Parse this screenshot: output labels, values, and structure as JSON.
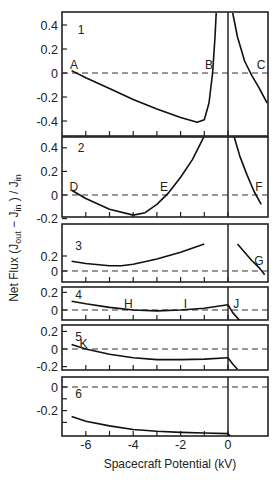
{
  "chart_data": {
    "type": "line",
    "title": "",
    "xlabel": "Spacecraft Potential (kV)",
    "ylabel": "Net Flux (J_out - J_in) / J_in",
    "xlim": [
      -7.0,
      1.7
    ],
    "x_ticks": [
      -6,
      -5,
      -4,
      -3,
      -2,
      -1,
      0
    ],
    "x_tick_labels": [
      "-6",
      "-4",
      "-2",
      "0"
    ],
    "x_tick_label_values": [
      -6,
      -4,
      -2,
      0
    ],
    "grid": false,
    "zero_line": "dashed",
    "vertical_line_at": 0,
    "panels": [
      {
        "id": "1",
        "ylim": [
          -0.5,
          0.5
        ],
        "y_ticks": [
          0.4,
          0.2,
          0,
          -0.2,
          -0.4
        ],
        "y_tick_labels": [
          "0.4",
          "0.2",
          "0",
          "-0.2",
          "-0.4"
        ],
        "px": {
          "top": 12,
          "bottom": 136,
          "y0": 73,
          "unit": 120
        },
        "series": [
          {
            "name": "negative branch",
            "x": [
              -6.6,
              -6.0,
              -5.0,
              -4.0,
              -3.0,
              -2.0,
              -1.3,
              -1.0,
              -0.8,
              -0.65,
              -0.55,
              -0.5
            ],
            "y": [
              0.02,
              -0.04,
              -0.13,
              -0.22,
              -0.3,
              -0.37,
              -0.41,
              -0.39,
              -0.25,
              0.0,
              0.3,
              0.5
            ]
          },
          {
            "name": "positive branch",
            "x": [
              0.2,
              0.4,
              0.7,
              1.0,
              1.3,
              1.65
            ],
            "y": [
              0.5,
              0.3,
              0.1,
              -0.02,
              -0.12,
              -0.25
            ]
          }
        ],
        "annotations": [
          {
            "text": "1",
            "x": -6.2,
            "y": 0.36
          },
          {
            "text": "A",
            "x": -6.5,
            "y": 0.07
          },
          {
            "text": "B",
            "x": -0.8,
            "y": 0.07
          },
          {
            "text": "C",
            "x": 1.4,
            "y": 0.07
          }
        ]
      },
      {
        "id": "2",
        "ylim": [
          -0.25,
          0.5
        ],
        "y_ticks": [
          0.4,
          0.2,
          0,
          -0.2
        ],
        "y_tick_labels": [
          "0.4",
          "0.2",
          "0",
          "-0.2"
        ],
        "px": {
          "top": 137,
          "bottom": 217,
          "y0": 195,
          "unit": 118
        },
        "series": [
          {
            "name": "negative branch",
            "x": [
              -6.6,
              -6.0,
              -5.0,
              -4.0,
              -3.5,
              -3.0,
              -2.5,
              -2.0,
              -1.5,
              -1.0
            ],
            "y": [
              0.04,
              -0.03,
              -0.12,
              -0.17,
              -0.15,
              -0.08,
              0.02,
              0.15,
              0.3,
              0.5
            ]
          },
          {
            "name": "positive branch",
            "x": [
              0.25,
              0.5,
              0.8,
              1.1,
              1.4
            ],
            "y": [
              0.5,
              0.33,
              0.17,
              0.03,
              -0.08
            ]
          }
        ],
        "annotations": [
          {
            "text": "2",
            "x": -6.2,
            "y": 0.4
          },
          {
            "text": "D",
            "x": -6.5,
            "y": 0.07
          },
          {
            "text": "E",
            "x": -2.7,
            "y": 0.07
          },
          {
            "text": "F",
            "x": 1.3,
            "y": 0.07
          }
        ]
      },
      {
        "id": "3",
        "ylim": [
          -0.07,
          0.45
        ],
        "y_ticks": [
          0.2,
          0
        ],
        "y_tick_labels": [
          "0.2",
          "0"
        ],
        "px": {
          "top": 224,
          "bottom": 282,
          "y0": 271,
          "unit": 75
        },
        "series": [
          {
            "name": "negative branch",
            "x": [
              -6.6,
              -6.0,
              -5.0,
              -4.5,
              -4.0,
              -3.0,
              -2.0,
              -1.0
            ],
            "y": [
              0.13,
              0.1,
              0.07,
              0.07,
              0.09,
              0.16,
              0.25,
              0.36
            ]
          },
          {
            "name": "positive branch",
            "x": [
              0.4,
              0.7,
              1.0,
              1.3,
              1.55
            ],
            "y": [
              0.36,
              0.25,
              0.14,
              0.05,
              -0.05
            ]
          }
        ],
        "annotations": [
          {
            "text": "3",
            "x": -6.3,
            "y": 0.33
          },
          {
            "text": "G",
            "x": 1.3,
            "y": 0.13
          }
        ]
      },
      {
        "id": "4",
        "ylim": [
          -0.1,
          0.27
        ],
        "y_ticks": [
          0.2,
          0
        ],
        "y_tick_labels": [
          "0.2",
          "0"
        ],
        "px": {
          "top": 287,
          "bottom": 320,
          "y0": 310,
          "unit": 88
        },
        "series": [
          {
            "name": "negative branch",
            "x": [
              -6.6,
              -6.0,
              -5.0,
              -4.0,
              -3.0,
              -2.0,
              -1.0,
              0.0
            ],
            "y": [
              0.1,
              0.07,
              0.03,
              0.0,
              -0.01,
              0.0,
              0.02,
              0.06
            ]
          },
          {
            "name": "positive branch",
            "x": [
              0.0,
              0.2,
              0.5
            ],
            "y": [
              0.06,
              -0.03,
              -0.12
            ]
          }
        ],
        "annotations": [
          {
            "text": "4",
            "x": -6.3,
            "y": 0.17
          },
          {
            "text": "H",
            "x": -4.2,
            "y": 0.07
          },
          {
            "text": "I",
            "x": -1.8,
            "y": 0.07
          },
          {
            "text": "J",
            "x": 0.35,
            "y": 0.07
          }
        ]
      },
      {
        "id": "5",
        "ylim": [
          -0.23,
          0.27
        ],
        "y_ticks": [
          0.2,
          0,
          -0.2
        ],
        "y_tick_labels": [
          "0.2",
          "0",
          "-0.2"
        ],
        "px": {
          "top": 325,
          "bottom": 370,
          "y0": 349,
          "unit": 88
        },
        "series": [
          {
            "name": "negative branch",
            "x": [
              -6.6,
              -6.0,
              -5.0,
              -4.0,
              -3.0,
              -2.0,
              -1.0,
              0.0
            ],
            "y": [
              0.05,
              0.0,
              -0.06,
              -0.1,
              -0.12,
              -0.12,
              -0.115,
              -0.1
            ]
          },
          {
            "name": "positive branch",
            "x": [
              0.0,
              0.2,
              0.4
            ],
            "y": [
              -0.1,
              -0.17,
              -0.23
            ]
          }
        ],
        "annotations": [
          {
            "text": "5",
            "x": -6.3,
            "y": 0.14
          },
          {
            "text": "K",
            "x": -6.1,
            "y": 0.06
          }
        ]
      },
      {
        "id": "6",
        "ylim": [
          -0.42,
          0.09
        ],
        "y_ticks": [
          0,
          -0.1,
          -0.2,
          -0.3
        ],
        "y_tick_labels": [
          "0",
          "",
          "-0.2",
          ""
        ],
        "px": {
          "top": 377,
          "bottom": 436,
          "y0": 387,
          "unit": 118
        },
        "series": [
          {
            "name": "negative branch",
            "x": [
              -6.6,
              -6.0,
              -5.0,
              -4.0,
              -3.0,
              -2.0,
              -1.0,
              0.0
            ],
            "y": [
              -0.25,
              -0.29,
              -0.33,
              -0.36,
              -0.375,
              -0.385,
              -0.39,
              -0.395
            ]
          },
          {
            "name": "positive branch",
            "x": [
              0.0,
              0.1
            ],
            "y": [
              -0.395,
              -0.42
            ]
          }
        ],
        "annotations": [
          {
            "text": "6",
            "x": -6.3,
            "y": -0.06
          }
        ]
      }
    ]
  },
  "layout_px": {
    "plot_left": 62,
    "plot_right": 268,
    "x_zero_px": 228,
    "px_per_kv": 23.7,
    "x_tick_label_y": 449,
    "xlabel_y": 468,
    "ylabel_x": 18,
    "ylabel_y": 238
  }
}
